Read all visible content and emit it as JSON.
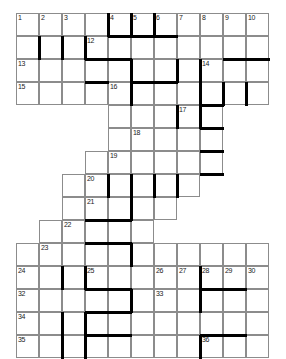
{
  "puzzle": {
    "kind": "crossword-grid",
    "shape": "staircase",
    "columns": 11,
    "rows": 14,
    "cell_size_px": 23,
    "grid_origin": {
      "x": 16,
      "y": 13
    },
    "colors": {
      "cell_background": "#ffffff",
      "cell_border": "#8c8c8c",
      "thick_bar": "#000000",
      "number_text": "#1a1a1a",
      "page_background": "#ffffff"
    },
    "rows_extent": [
      {
        "row": 0,
        "col_start": 0,
        "col_end": 10
      },
      {
        "row": 1,
        "col_start": 0,
        "col_end": 10
      },
      {
        "row": 2,
        "col_start": 0,
        "col_end": 10
      },
      {
        "row": 3,
        "col_start": 0,
        "col_end": 10
      },
      {
        "row": 4,
        "col_start": 4,
        "col_end": 8
      },
      {
        "row": 5,
        "col_start": 4,
        "col_end": 8
      },
      {
        "row": 6,
        "col_start": 3,
        "col_end": 8
      },
      {
        "row": 7,
        "col_start": 2,
        "col_end": 7
      },
      {
        "row": 8,
        "col_start": 2,
        "col_end": 6
      },
      {
        "row": 9,
        "col_start": 1,
        "col_end": 5
      },
      {
        "row": 10,
        "col_start": 0,
        "col_end": 10
      },
      {
        "row": 11,
        "col_start": 0,
        "col_end": 10
      },
      {
        "row": 12,
        "col_start": 0,
        "col_end": 10
      },
      {
        "row": 13,
        "col_start": 0,
        "col_end": 10
      }
    ],
    "numbers": [
      {
        "n": "1",
        "row": 0,
        "col": 0
      },
      {
        "n": "2",
        "row": 0,
        "col": 1
      },
      {
        "n": "3",
        "row": 0,
        "col": 2
      },
      {
        "n": "4",
        "row": 0,
        "col": 4
      },
      {
        "n": "5",
        "row": 0,
        "col": 5
      },
      {
        "n": "6",
        "row": 0,
        "col": 6
      },
      {
        "n": "7",
        "row": 0,
        "col": 7
      },
      {
        "n": "8",
        "row": 0,
        "col": 8
      },
      {
        "n": "9",
        "row": 0,
        "col": 9
      },
      {
        "n": "10",
        "row": 0,
        "col": 10
      },
      {
        "n": "11",
        "row": 0,
        "col": 11
      },
      {
        "n": "12",
        "row": 1,
        "col": 3
      },
      {
        "n": "13",
        "row": 2,
        "col": 0
      },
      {
        "n": "14",
        "row": 2,
        "col": 8
      },
      {
        "n": "15",
        "row": 3,
        "col": 0
      },
      {
        "n": "16",
        "row": 3,
        "col": 4
      },
      {
        "n": "17",
        "row": 4,
        "col": 7
      },
      {
        "n": "18",
        "row": 5,
        "col": 5
      },
      {
        "n": "19",
        "row": 6,
        "col": 4
      },
      {
        "n": "20",
        "row": 7,
        "col": 3
      },
      {
        "n": "21",
        "row": 8,
        "col": 3
      },
      {
        "n": "22",
        "row": 9,
        "col": 2
      },
      {
        "n": "23",
        "row": 10,
        "col": 1
      },
      {
        "n": "24",
        "row": 11,
        "col": 0
      },
      {
        "n": "25",
        "row": 11,
        "col": 3
      },
      {
        "n": "26",
        "row": 11,
        "col": 6
      },
      {
        "n": "27",
        "row": 11,
        "col": 7
      },
      {
        "n": "28",
        "row": 11,
        "col": 8
      },
      {
        "n": "29",
        "row": 11,
        "col": 9
      },
      {
        "n": "30",
        "row": 11,
        "col": 10
      },
      {
        "n": "31",
        "row": 11,
        "col": 11
      },
      {
        "n": "32",
        "row": 12,
        "col": 0
      },
      {
        "n": "33",
        "row": 12,
        "col": 6
      },
      {
        "n": "34",
        "row": 13,
        "col": 0
      },
      {
        "n": "35",
        "row": 14,
        "col": 0
      },
      {
        "n": "36",
        "row": 14,
        "col": 8
      }
    ]
  }
}
